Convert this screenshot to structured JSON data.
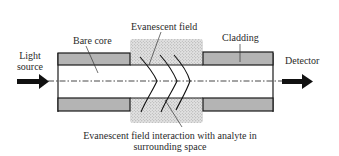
{
  "diagram": {
    "labels": {
      "light_source_line1": "Light",
      "light_source_line2": "source",
      "bare_core": "Bare core",
      "evanescent_field": "Evanescent field",
      "cladding": "Cladding",
      "detector": "Detector",
      "interaction_line1": "Evanescent field interaction with analyte in",
      "interaction_line2": "surrounding space"
    },
    "colors": {
      "cladding_fill": "#b4b4b4",
      "stipple_fill": "#d6d6d6",
      "outline": "#1a1a1a",
      "arrow": "#111111"
    },
    "components": [
      {
        "name": "light-source",
        "type": "input-arrow"
      },
      {
        "name": "left-cladding",
        "type": "cladding-segment"
      },
      {
        "name": "bare-core-sensing-region",
        "type": "unclad-core"
      },
      {
        "name": "evanescent-field-region",
        "type": "stippled-analyte-zone"
      },
      {
        "name": "right-cladding",
        "type": "cladding-segment"
      },
      {
        "name": "detector",
        "type": "output-arrow"
      }
    ]
  }
}
